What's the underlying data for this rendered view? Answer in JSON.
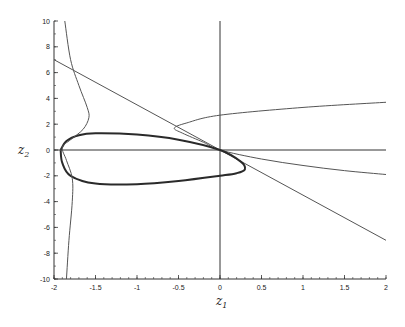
{
  "chart_data": {
    "type": "line",
    "title": "",
    "xlabel": "z1",
    "ylabel": "z2",
    "xlim": [
      -2,
      2
    ],
    "ylim": [
      -10,
      10
    ],
    "grid": false,
    "legend": null,
    "x_ticks": [
      "-2",
      "-1.5",
      "-1",
      "-0.5",
      "0",
      "0.5",
      "1",
      "1.5",
      "2"
    ],
    "y_ticks": [
      "-10",
      "-8",
      "-6",
      "-4",
      "-2",
      "0",
      "2",
      "4",
      "6",
      "8",
      "10"
    ],
    "series": [
      {
        "name": "straight line",
        "style": "thin",
        "points": [
          [
            -2,
            7
          ],
          [
            2,
            -7
          ]
        ]
      },
      {
        "name": "right-opening branch",
        "style": "thin",
        "points": [
          [
            2,
            3.7
          ],
          [
            1,
            3.3
          ],
          [
            0,
            2.7
          ],
          [
            -0.4,
            2.1
          ],
          [
            -0.55,
            1.7
          ],
          [
            -0.45,
            1.3
          ],
          [
            -0.2,
            0.6
          ],
          [
            0,
            0
          ],
          [
            0.5,
            -0.7
          ],
          [
            1,
            -1.2
          ],
          [
            1.5,
            -1.6
          ],
          [
            2,
            -1.9
          ]
        ]
      },
      {
        "name": "closed loop",
        "style": "thick",
        "points": [
          [
            -1.92,
            0
          ],
          [
            -1.85,
            0.7
          ],
          [
            -1.7,
            1.15
          ],
          [
            -1.5,
            1.3
          ],
          [
            -1,
            1.2
          ],
          [
            -0.5,
            0.8
          ],
          [
            0,
            0
          ],
          [
            0.25,
            -0.9
          ],
          [
            0.3,
            -1.5
          ],
          [
            0.2,
            -1.8
          ],
          [
            0,
            -2.0
          ],
          [
            -0.5,
            -2.4
          ],
          [
            -1,
            -2.65
          ],
          [
            -1.5,
            -2.6
          ],
          [
            -1.8,
            -2.0
          ],
          [
            -1.9,
            -1.0
          ],
          [
            -1.92,
            0
          ]
        ]
      },
      {
        "name": "left vertical curve",
        "style": "thin",
        "points": [
          [
            -1.87,
            10
          ],
          [
            -1.8,
            7
          ],
          [
            -1.7,
            5
          ],
          [
            -1.6,
            3.3
          ],
          [
            -1.58,
            2.5
          ],
          [
            -1.65,
            1.6
          ],
          [
            -1.8,
            0.8
          ],
          [
            -1.9,
            0.2
          ],
          [
            -1.85,
            -0.8
          ],
          [
            -1.78,
            -2.2
          ],
          [
            -1.78,
            -4
          ],
          [
            -1.82,
            -7
          ],
          [
            -1.85,
            -10
          ]
        ]
      }
    ]
  },
  "axes": {
    "xlabel_main": "z",
    "xlabel_sub": "1",
    "ylabel_main": "z",
    "ylabel_sub": "2"
  }
}
